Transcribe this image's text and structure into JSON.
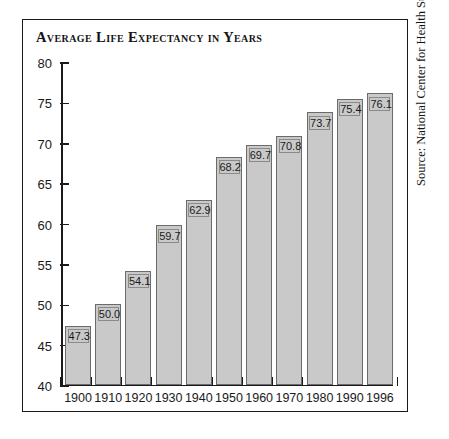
{
  "chart_data": {
    "type": "bar",
    "title": "Average Life Expectancy in Years",
    "xlabel": "",
    "ylabel": "",
    "ylim": [
      40,
      80
    ],
    "ytick_step": 5,
    "yticks": [
      "80",
      "75",
      "70",
      "65",
      "60",
      "55",
      "50",
      "45",
      "40"
    ],
    "grid": false,
    "legend": "none",
    "categories": [
      "1900",
      "1910",
      "1920",
      "1930",
      "1940",
      "1950",
      "1960",
      "1970",
      "1980",
      "1990",
      "1996"
    ],
    "values": [
      47.3,
      50.0,
      54.1,
      59.7,
      62.9,
      68.2,
      69.7,
      70.8,
      73.7,
      75.4,
      76.1
    ],
    "value_labels": [
      "47.3",
      "50.0",
      "54.1",
      "59.7",
      "62.9",
      "68.2",
      "69.7",
      "70.8",
      "73.7",
      "75.4",
      "76.1"
    ],
    "bar_fill_color": "#c9c9c9",
    "bar_border_color": "#6b6b6b",
    "axis_color": "#1a1a1a"
  },
  "source": {
    "text": "Source: National Center for Health Statistics."
  }
}
